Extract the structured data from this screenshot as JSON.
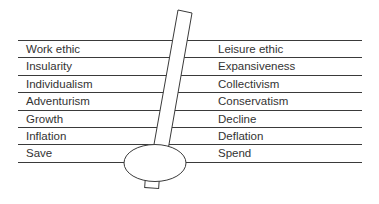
{
  "diagram": {
    "rows": [
      {
        "left": "Work ethic",
        "right": "Leisure ethic"
      },
      {
        "left": "Insularity",
        "right": "Expansiveness"
      },
      {
        "left": "Individualism",
        "right": "Collectivism"
      },
      {
        "left": "Adventurism",
        "right": "Conservatism"
      },
      {
        "left": "Growth",
        "right": "Decline"
      },
      {
        "left": "Inflation",
        "right": "Deflation"
      },
      {
        "left": "Save",
        "right": "Spend"
      }
    ],
    "colors": {
      "line": "#3a3a3a",
      "text": "#333333",
      "background": "#ffffff"
    }
  }
}
